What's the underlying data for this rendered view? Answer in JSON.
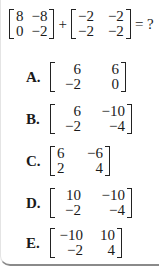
{
  "question": {
    "matrix_a": [
      [
        "8",
        "−8"
      ],
      [
        "0",
        "−2"
      ]
    ],
    "operator": "+",
    "matrix_b": [
      [
        "−2",
        "−2"
      ],
      [
        "−2",
        "−2"
      ]
    ],
    "equals": "= ?"
  },
  "options": [
    {
      "letter": "A.",
      "matrix": [
        [
          "6",
          "6"
        ],
        [
          "−2",
          "0"
        ]
      ]
    },
    {
      "letter": "B.",
      "matrix": [
        [
          "6",
          "−10"
        ],
        [
          "−2",
          "−4"
        ]
      ]
    },
    {
      "letter": "C.",
      "matrix": [
        [
          "6",
          "−6"
        ],
        [
          "2",
          "4"
        ]
      ]
    },
    {
      "letter": "D.",
      "matrix": [
        [
          "10",
          "−10"
        ],
        [
          "−2",
          "−4"
        ]
      ]
    },
    {
      "letter": "E.",
      "matrix": [
        [
          "−10",
          "10"
        ],
        [
          "−2",
          "4"
        ]
      ]
    }
  ]
}
